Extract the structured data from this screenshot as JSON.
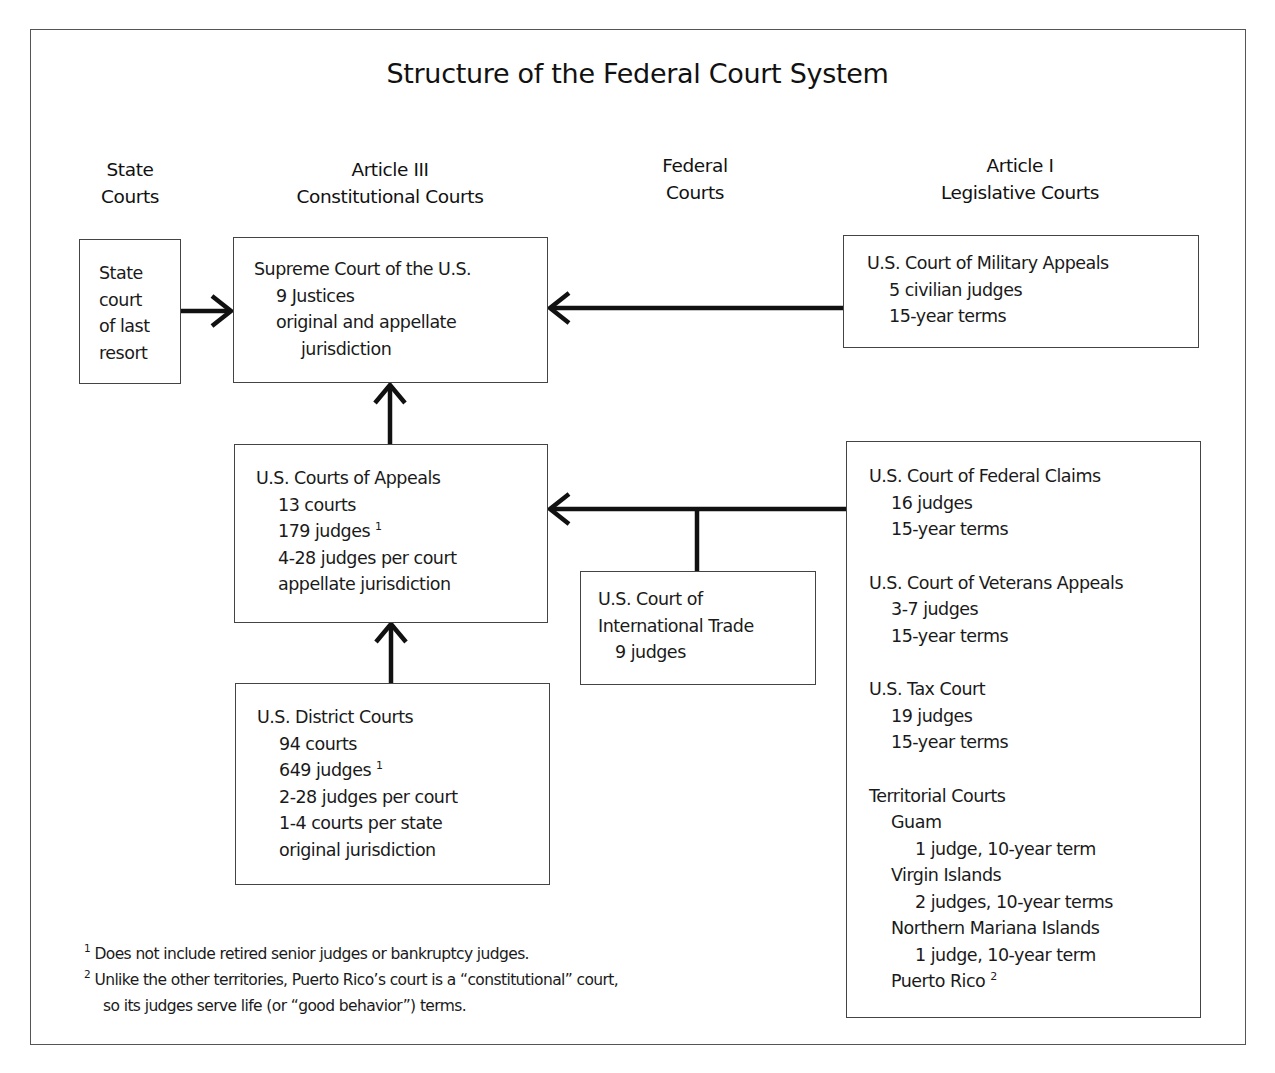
{
  "title": "Structure of the Federal Court System",
  "columns": {
    "state": [
      "State",
      "Courts"
    ],
    "article3": [
      "Article III",
      "Constitutional Courts"
    ],
    "federal": [
      "Federal",
      "Courts"
    ],
    "article1": [
      "Article I",
      "Legislative Courts"
    ]
  },
  "boxes": {
    "state_court": {
      "lines": [
        "State",
        "court",
        "of last",
        "resort"
      ]
    },
    "supreme_court": {
      "name": "Supreme Court of the U.S.",
      "justices": "9 Justices",
      "jurisdiction_1": "original and appellate",
      "jurisdiction_2": "jurisdiction"
    },
    "courts_of_appeals": {
      "name": "U.S. Courts of Appeals",
      "courts": "13 courts",
      "judges": "179 judges",
      "judges_note": "1",
      "per_court": "4-28 judges per court",
      "jurisdiction": "appellate jurisdiction"
    },
    "district_courts": {
      "name": "U.S. District Courts",
      "courts": "94 courts",
      "judges": "649 judges",
      "judges_note": "1",
      "per_court": "2-28 judges per court",
      "per_state": "1-4 courts per state",
      "jurisdiction": "original jurisdiction"
    },
    "international_trade": {
      "name_1": "U.S. Court of",
      "name_2": "International Trade",
      "judges": "9 judges"
    },
    "military_appeals": {
      "name": "U.S. Court of Military Appeals",
      "judges": "5 civilian judges",
      "terms": "15-year terms"
    },
    "legislative": {
      "federal_claims": {
        "name": "U.S. Court of Federal Claims",
        "judges": "16 judges",
        "terms": "15-year terms"
      },
      "veterans_appeals": {
        "name": "U.S. Court of Veterans Appeals",
        "judges": "3-7 judges",
        "terms": "15-year terms"
      },
      "tax_court": {
        "name": "U.S. Tax Court",
        "judges": "19 judges",
        "terms": "15-year terms"
      },
      "territorial": {
        "name": "Territorial Courts",
        "guam": "Guam",
        "guam_detail": "1 judge, 10-year term",
        "virgin_islands": "Virgin Islands",
        "virgin_islands_detail": "2 judges, 10-year terms",
        "northern_mariana": "Northern Mariana Islands",
        "northern_mariana_detail": "1 judge, 10-year term",
        "puerto_rico": "Puerto Rico",
        "puerto_rico_note": "2"
      }
    }
  },
  "footnotes": {
    "n1_mark": "1",
    "n1_text": "Does not include retired senior judges or bankruptcy judges.",
    "n2_mark": "2",
    "n2_text_1": "Unlike the other territories, Puerto Rico’s court is a “constitutional” court,",
    "n2_text_2": "so its judges serve life (or “good behavior”) terms."
  },
  "colors": {
    "line": "#111111",
    "border": "#444444",
    "background": "#ffffff"
  }
}
